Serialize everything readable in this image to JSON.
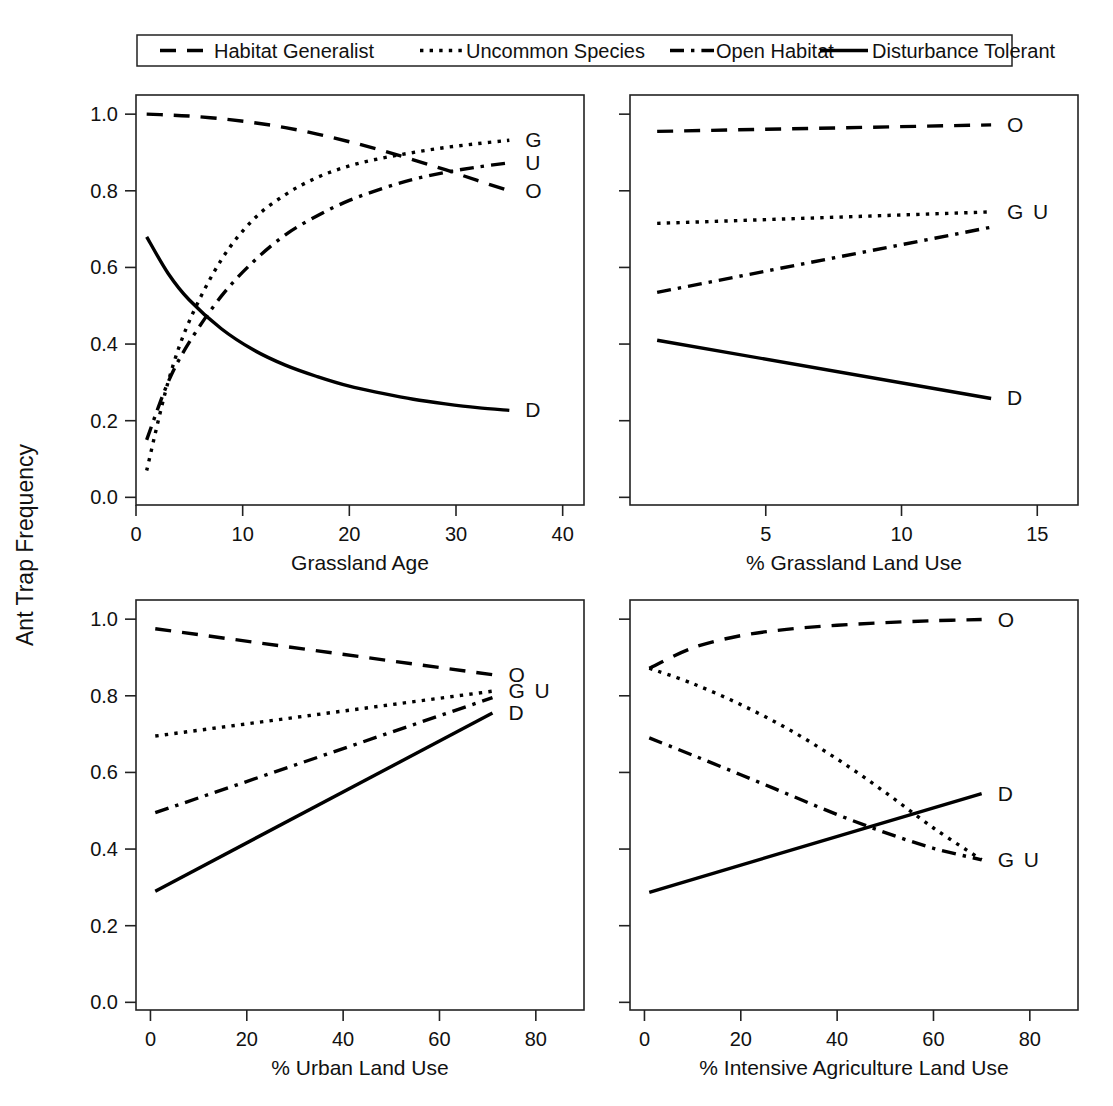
{
  "figure": {
    "ylabel": "Ant Trap Frequency",
    "legend": {
      "position": "top",
      "entries": [
        {
          "label": "Habitat Generalist",
          "style": "dashed",
          "code": "O"
        },
        {
          "label": "Uncommon Species",
          "style": "dotted",
          "code": "G"
        },
        {
          "label": "Open Habitat",
          "style": "dashdot",
          "code": "U"
        },
        {
          "label": "Disturbance Tolerant",
          "style": "solid",
          "code": "D"
        }
      ]
    },
    "y_ticks": [
      "0.0",
      "0.2",
      "0.4",
      "0.6",
      "0.8",
      "1.0"
    ]
  },
  "chart_data": [
    {
      "type": "line",
      "panel": "top-left",
      "title": "",
      "xlabel": "Grassland Age",
      "ylabel": "Ant Trap Frequency",
      "xlim": [
        0,
        42
      ],
      "ylim": [
        -0.02,
        1.05
      ],
      "xticks": [
        0,
        10,
        20,
        30,
        40
      ],
      "xticklabels": [
        "0",
        "10",
        "20",
        "30",
        "40"
      ],
      "yticks": [
        0.0,
        0.2,
        0.4,
        0.6,
        0.8,
        1.0
      ],
      "yticklabels": [
        "0.0",
        "0.2",
        "0.4",
        "0.6",
        "0.8",
        "1.0"
      ],
      "y_labels_shown": true,
      "grid": false,
      "series": [
        {
          "name": "Habitat Generalist",
          "code": "O",
          "style": "dashed",
          "end_label": "O",
          "x": [
            1,
            3,
            5,
            8,
            11,
            14,
            17,
            20,
            23,
            26,
            29,
            32,
            35
          ],
          "values": [
            1.0,
            0.998,
            0.995,
            0.988,
            0.978,
            0.965,
            0.948,
            0.928,
            0.906,
            0.881,
            0.855,
            0.827,
            0.8
          ]
        },
        {
          "name": "Uncommon Species",
          "code": "G",
          "style": "dotted",
          "end_label": "G",
          "x": [
            1,
            3,
            5,
            8,
            11,
            14,
            17,
            20,
            23,
            26,
            29,
            32,
            35
          ],
          "values": [
            0.07,
            0.3,
            0.46,
            0.62,
            0.725,
            0.79,
            0.835,
            0.865,
            0.885,
            0.9,
            0.913,
            0.923,
            0.932
          ]
        },
        {
          "name": "Open Habitat",
          "code": "U",
          "style": "dashdot",
          "end_label": "U",
          "x": [
            1,
            3,
            5,
            8,
            11,
            14,
            17,
            20,
            23,
            26,
            29,
            32,
            35
          ],
          "values": [
            0.15,
            0.3,
            0.405,
            0.525,
            0.615,
            0.685,
            0.735,
            0.775,
            0.805,
            0.83,
            0.848,
            0.862,
            0.873
          ]
        },
        {
          "name": "Disturbance Tolerant",
          "code": "D",
          "style": "solid",
          "end_label": "D",
          "x": [
            1,
            3,
            5,
            8,
            11,
            14,
            17,
            20,
            23,
            26,
            29,
            32,
            35
          ],
          "values": [
            0.68,
            0.585,
            0.515,
            0.44,
            0.385,
            0.345,
            0.315,
            0.29,
            0.272,
            0.256,
            0.244,
            0.234,
            0.227
          ]
        }
      ]
    },
    {
      "type": "line",
      "panel": "top-right",
      "title": "",
      "xlabel": "% Grassland Land Use",
      "ylabel": "Ant Trap Frequency",
      "xlim": [
        0,
        16.5
      ],
      "ylim": [
        -0.02,
        1.05
      ],
      "xticks": [
        5,
        10,
        15
      ],
      "xticklabels": [
        "5",
        "10",
        "15"
      ],
      "yticks": [
        0.0,
        0.2,
        0.4,
        0.6,
        0.8,
        1.0
      ],
      "yticklabels": [],
      "y_labels_shown": false,
      "grid": false,
      "series": [
        {
          "name": "Habitat Generalist",
          "code": "O",
          "style": "dashed",
          "end_label": "O",
          "x": [
            1,
            13.3
          ],
          "values": [
            0.955,
            0.972
          ]
        },
        {
          "name": "Uncommon Species",
          "code": "G",
          "style": "dotted",
          "end_label": "G",
          "x": [
            1,
            13.3
          ],
          "values": [
            0.715,
            0.745
          ]
        },
        {
          "name": "Open Habitat",
          "code": "U",
          "style": "dashdot",
          "end_label": "U",
          "x": [
            1,
            13.3
          ],
          "values": [
            0.535,
            0.705
          ]
        },
        {
          "name": "Disturbance Tolerant",
          "code": "D",
          "style": "solid",
          "end_label": "D",
          "x": [
            1,
            13.3
          ],
          "values": [
            0.41,
            0.258
          ]
        }
      ]
    },
    {
      "type": "line",
      "panel": "bottom-left",
      "title": "",
      "xlabel": "% Urban Land Use",
      "ylabel": "Ant Trap Frequency",
      "xlim": [
        -3,
        90
      ],
      "ylim": [
        -0.02,
        1.05
      ],
      "xticks": [
        0,
        20,
        40,
        60,
        80
      ],
      "xticklabels": [
        "0",
        "20",
        "40",
        "60",
        "80"
      ],
      "yticks": [
        0.0,
        0.2,
        0.4,
        0.6,
        0.8,
        1.0
      ],
      "yticklabels": [
        "0.0",
        "0.2",
        "0.4",
        "0.6",
        "0.8",
        "1.0"
      ],
      "y_labels_shown": true,
      "grid": false,
      "series": [
        {
          "name": "Habitat Generalist",
          "code": "O",
          "style": "dashed",
          "end_label": "O",
          "x": [
            1,
            71
          ],
          "values": [
            0.975,
            0.855
          ]
        },
        {
          "name": "Uncommon Species",
          "code": "G",
          "style": "dotted",
          "end_label": "G",
          "x": [
            1,
            71
          ],
          "values": [
            0.695,
            0.812
          ]
        },
        {
          "name": "Open Habitat",
          "code": "U",
          "style": "dashdot",
          "end_label": "U",
          "x": [
            1,
            71
          ],
          "values": [
            0.495,
            0.795
          ]
        },
        {
          "name": "Disturbance Tolerant",
          "code": "D",
          "style": "solid",
          "end_label": "D",
          "x": [
            1,
            71
          ],
          "values": [
            0.29,
            0.755
          ]
        }
      ]
    },
    {
      "type": "line",
      "panel": "bottom-right",
      "title": "",
      "xlabel": "% Intensive Agriculture Land Use",
      "ylabel": "Ant Trap Frequency",
      "xlim": [
        -3,
        90
      ],
      "ylim": [
        -0.02,
        1.05
      ],
      "xticks": [
        0,
        20,
        40,
        60,
        80
      ],
      "xticklabels": [
        "0",
        "20",
        "40",
        "60",
        "80"
      ],
      "yticks": [
        0.0,
        0.2,
        0.4,
        0.6,
        0.8,
        1.0
      ],
      "yticklabels": [],
      "y_labels_shown": false,
      "grid": false,
      "series": [
        {
          "name": "Habitat Generalist",
          "code": "O",
          "style": "dashed",
          "end_label": "O",
          "x": [
            1,
            10,
            20,
            30,
            40,
            50,
            60,
            70
          ],
          "values": [
            0.872,
            0.925,
            0.957,
            0.974,
            0.984,
            0.991,
            0.996,
            0.999
          ]
        },
        {
          "name": "Uncommon Species",
          "code": "G",
          "style": "dotted",
          "end_label": "G",
          "x": [
            1,
            10,
            20,
            30,
            40,
            50,
            60,
            70
          ],
          "values": [
            0.872,
            0.832,
            0.777,
            0.712,
            0.635,
            0.548,
            0.455,
            0.372
          ]
        },
        {
          "name": "Open Habitat",
          "code": "U",
          "style": "dashdot",
          "end_label": "U",
          "x": [
            1,
            10,
            20,
            30,
            40,
            50,
            60,
            70
          ],
          "values": [
            0.69,
            0.645,
            0.594,
            0.542,
            0.49,
            0.443,
            0.402,
            0.372
          ]
        },
        {
          "name": "Disturbance Tolerant",
          "code": "D",
          "style": "solid",
          "end_label": "D",
          "x": [
            1,
            70
          ],
          "values": [
            0.287,
            0.545
          ]
        }
      ]
    }
  ]
}
